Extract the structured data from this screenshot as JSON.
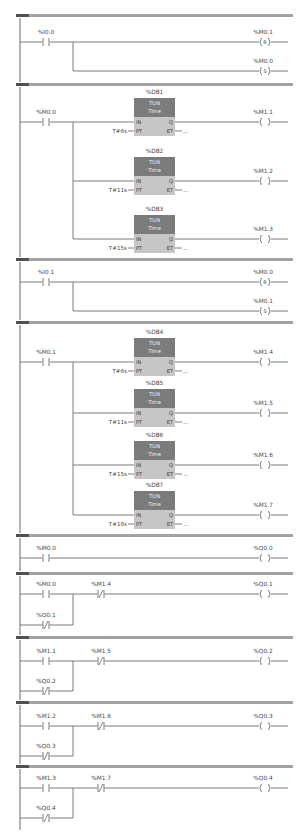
{
  "timer_pins": {
    "in": "IN",
    "pt": "PT",
    "q": "Q",
    "et": "ET"
  },
  "networks": [
    {
      "contacts": [
        {
          "address": "%I0.0",
          "type": "normally-open"
        }
      ],
      "coils": [
        {
          "address": "%M0.1",
          "function": "R"
        },
        {
          "address": "%M0.0",
          "function": "S"
        }
      ]
    },
    {
      "contacts": [
        {
          "address": "%M0.0",
          "type": "normally-open"
        }
      ],
      "timers": [
        {
          "instance": "%DB1",
          "type": "TON",
          "subtitle": "Time",
          "preset": "T#6s",
          "elapsed": "..."
        },
        {
          "instance": "%DB2",
          "type": "TON",
          "subtitle": "Time",
          "preset": "T#11s",
          "elapsed": "..."
        },
        {
          "instance": "%DB3",
          "type": "TON",
          "subtitle": "Time",
          "preset": "T#15s",
          "elapsed": "..."
        }
      ],
      "coils": [
        {
          "address": "%M1.1",
          "function": ""
        },
        {
          "address": "%M1.2",
          "function": ""
        },
        {
          "address": "%M1.3",
          "function": ""
        }
      ]
    },
    {
      "contacts": [
        {
          "address": "%I0.1",
          "type": "normally-open"
        }
      ],
      "coils": [
        {
          "address": "%M0.0",
          "function": "R"
        },
        {
          "address": "%M0.1",
          "function": "S"
        }
      ]
    },
    {
      "contacts": [
        {
          "address": "%M0.1",
          "type": "normally-open"
        }
      ],
      "timers": [
        {
          "instance": "%DB4",
          "type": "TON",
          "subtitle": "Time",
          "preset": "T#6s",
          "elapsed": "..."
        },
        {
          "instance": "%DB5",
          "type": "TON",
          "subtitle": "Time",
          "preset": "T#11s",
          "elapsed": "..."
        },
        {
          "instance": "%DB6",
          "type": "TON",
          "subtitle": "Time",
          "preset": "T#15s",
          "elapsed": "..."
        },
        {
          "instance": "%DB7",
          "type": "TON",
          "subtitle": "Time",
          "preset": "T#18s",
          "elapsed": "..."
        }
      ],
      "coils": [
        {
          "address": "%M1.4",
          "function": ""
        },
        {
          "address": "%M1.5",
          "function": ""
        },
        {
          "address": "%M1.6",
          "function": ""
        },
        {
          "address": "%M1.7",
          "function": ""
        }
      ]
    },
    {
      "contacts": [
        {
          "address": "%M0.0",
          "type": "normally-open"
        }
      ],
      "coils": [
        {
          "address": "%Q0.0",
          "function": ""
        }
      ]
    },
    {
      "contacts": [
        {
          "address": "%M0.0",
          "type": "normally-open"
        },
        {
          "address": "%M1.4",
          "type": "normally-closed"
        },
        {
          "address": "%Q0.1",
          "type": "normally-closed"
        }
      ],
      "coils": [
        {
          "address": "%Q0.1",
          "function": ""
        }
      ]
    },
    {
      "contacts": [
        {
          "address": "%M1.1",
          "type": "normally-open"
        },
        {
          "address": "%M1.5",
          "type": "normally-closed"
        },
        {
          "address": "%Q0.2",
          "type": "normally-closed"
        }
      ],
      "coils": [
        {
          "address": "%Q0.2",
          "function": ""
        }
      ]
    },
    {
      "contacts": [
        {
          "address": "%M1.2",
          "type": "normally-open"
        },
        {
          "address": "%M1.6",
          "type": "normally-closed"
        },
        {
          "address": "%Q0.3",
          "type": "normally-closed"
        }
      ],
      "coils": [
        {
          "address": "%Q0.3",
          "function": ""
        }
      ]
    },
    {
      "contacts": [
        {
          "address": "%M1.3",
          "type": "normally-open"
        },
        {
          "address": "%M1.7",
          "type": "normally-closed"
        },
        {
          "address": "%Q0.4",
          "type": "normally-closed"
        }
      ],
      "coils": [
        {
          "address": "%Q0.4",
          "function": ""
        }
      ]
    }
  ]
}
